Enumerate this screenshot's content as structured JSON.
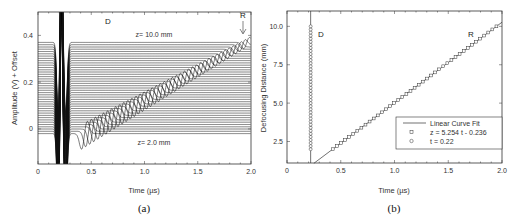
{
  "chart_data": [
    {
      "id": "a",
      "type": "line",
      "caption": "(a)",
      "title": "",
      "xlabel": "Time (µs)",
      "ylabel": "Amplitude (V) + Offset",
      "xlim": [
        0,
        2.0
      ],
      "ylim": [
        -0.15,
        0.5
      ],
      "xticks": [
        "0",
        "0.5",
        "1.0",
        "1.5",
        "2.0"
      ],
      "yticks": [
        "0",
        "0.2",
        "0.4"
      ],
      "grid": false,
      "annotations": [
        {
          "text": "D",
          "x": 0.3,
          "y": 0.46
        },
        {
          "text": "R",
          "x": 1.93,
          "y": 0.46,
          "arrow": "down"
        },
        {
          "text": "z= 10.0 mm",
          "x": 1.0,
          "y": 0.41
        },
        {
          "text": "z= 2.0 mm",
          "x": 1.0,
          "y": -0.06
        }
      ],
      "series_description": "Stacked waveforms for defocusing distances z = 2.0 mm (bottom) to 10.0 mm (top), offset vertically; direct wave D near t≈0.22 µs, reflected wave R arrival shifts linearly with z from ~0.42 µs to ~1.95 µs",
      "z_range_mm": [
        2.0,
        10.0
      ],
      "num_traces": 41,
      "baseline_offsets": {
        "bottom": -0.02,
        "top": 0.37
      }
    },
    {
      "id": "b",
      "type": "scatter",
      "caption": "(b)",
      "title": "",
      "xlabel": "Time (µs)",
      "ylabel": "Defocusing Distance (mm)",
      "xlim": [
        0,
        2.0
      ],
      "ylim": [
        1.1,
        11.0
      ],
      "xticks": [
        "0",
        "0.5",
        "1.0",
        "1.5",
        "2.0"
      ],
      "yticks": [
        "2.5",
        "5.0",
        "7.5",
        "10.0"
      ],
      "grid": false,
      "legend": {
        "position": "lower right",
        "entries": [
          {
            "marker": "line",
            "label": "Linear Curve Fit"
          },
          {
            "marker": "square",
            "label": "z = 5.254 t - 0.236"
          },
          {
            "marker": "circle",
            "label": "t = 0.22"
          }
        ]
      },
      "annotations": [
        {
          "text": "D",
          "x": 0.3,
          "y": 9.8
        },
        {
          "text": "R",
          "x": 1.68,
          "y": 9.8
        }
      ],
      "series": [
        {
          "name": "Linear Curve Fit",
          "type": "line",
          "slope": 5.254,
          "intercept": -0.236,
          "x": [
            0.25,
            2.0
          ],
          "y": [
            1.08,
            10.27
          ]
        },
        {
          "name": "z = 5.254 t - 0.236",
          "marker": "square",
          "x_from_z": "t=(z+0.236)/5.254",
          "z": [
            2.0,
            2.2,
            2.4,
            2.6,
            2.8,
            3.0,
            3.2,
            3.4,
            3.6,
            3.8,
            4.0,
            4.2,
            4.4,
            4.6,
            4.8,
            5.0,
            5.2,
            5.4,
            5.6,
            5.8,
            6.0,
            6.2,
            6.4,
            6.6,
            6.8,
            7.0,
            7.2,
            7.4,
            7.6,
            7.8,
            8.0,
            8.2,
            8.4,
            8.6,
            8.8,
            9.0,
            9.2,
            9.4,
            9.6,
            9.8,
            10.0
          ]
        },
        {
          "name": "t = 0.22",
          "marker": "circle",
          "x_const": 0.22,
          "z": [
            2.0,
            2.2,
            2.4,
            2.6,
            2.8,
            3.0,
            3.2,
            3.4,
            3.6,
            3.8,
            4.0,
            4.2,
            4.4,
            4.6,
            4.8,
            5.0,
            5.2,
            5.4,
            5.6,
            5.8,
            6.0,
            6.2,
            6.4,
            6.6,
            6.8,
            7.0,
            7.2,
            7.4,
            7.6,
            7.8,
            8.0,
            8.2,
            8.4,
            8.6,
            8.8,
            9.0,
            9.2,
            9.4,
            9.6,
            9.8,
            10.0
          ]
        }
      ]
    }
  ]
}
